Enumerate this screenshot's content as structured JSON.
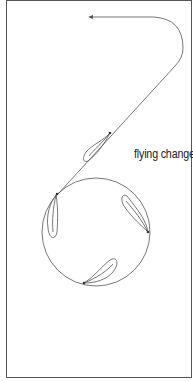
{
  "diagram": {
    "label": "flying change",
    "colors": {
      "line": "#555555",
      "frame": "#555555",
      "background": "#ffffff",
      "text": "#222222"
    },
    "elements": {
      "path": "track path with arrow (start at top-left arrowhead, curve right, diagonal down-left into circle)",
      "circle": "circle of travel",
      "hoofprints": [
        "upper-diagonal",
        "circle-left",
        "circle-right",
        "circle-bottom"
      ]
    }
  }
}
